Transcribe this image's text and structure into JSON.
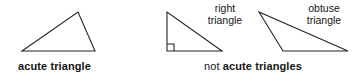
{
  "figure": {
    "line_color": "#242424",
    "text_color": "#161616",
    "background": "#ffffff",
    "width": 363,
    "height": 78
  },
  "groups": {
    "acute": {
      "caption": "acute triangle",
      "shape_name": "acute-triangle",
      "points": "22,51 78,12 95,51"
    },
    "not_acute": {
      "caption_prefix": "not ",
      "caption_strong": "acute triangles"
    }
  },
  "shapes": [
    {
      "name": "acute-triangle",
      "points": "22,51 78,12 95,51",
      "annotation_line1": "",
      "annotation_line2": ""
    },
    {
      "name": "right-triangle",
      "points": "167,12 167,51 222,51",
      "annotation_line1": "right",
      "annotation_line2": "triangle",
      "right_angle_marker": "167,44 174,44 174,51"
    },
    {
      "name": "obtuse-triangle",
      "points": "259,12 283,51 348,51",
      "annotation_line1": "obtuse",
      "annotation_line2": "triangle"
    }
  ],
  "annotations": {
    "right": {
      "line1": "right",
      "line2": "triangle"
    },
    "obtuse": {
      "line1": "obtuse",
      "line2": "triangle"
    }
  }
}
